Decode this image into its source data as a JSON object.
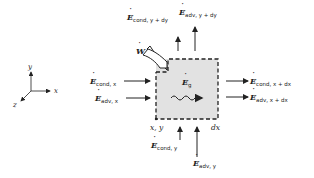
{
  "diagram": {
    "axes": {
      "x": "x",
      "y": "y",
      "z": "z"
    },
    "work_label": "W",
    "generation_label": {
      "symbol": "E",
      "sub": "g"
    },
    "corner_labels": {
      "origin": "x, y",
      "dx": "dx"
    },
    "flows": {
      "cond_y_dy": {
        "symbol": "E",
        "sub": "cond, y + dy"
      },
      "adv_y_dy": {
        "symbol": "E",
        "sub": "adv, y + dy"
      },
      "cond_x": {
        "symbol": "E",
        "sub": "cond, x"
      },
      "adv_x": {
        "symbol": "E",
        "sub": "adv, x"
      },
      "cond_x_dx": {
        "symbol": "E",
        "sub": "cond, x + dx"
      },
      "adv_x_dx": {
        "symbol": "E",
        "sub": "adv, x + dx"
      },
      "cond_y": {
        "symbol": "E",
        "sub": "cond, y"
      },
      "adv_y": {
        "symbol": "E",
        "sub": "adv, y"
      }
    },
    "colors": {
      "box_fill": "#e2e2e2",
      "ink": "#222222"
    }
  }
}
